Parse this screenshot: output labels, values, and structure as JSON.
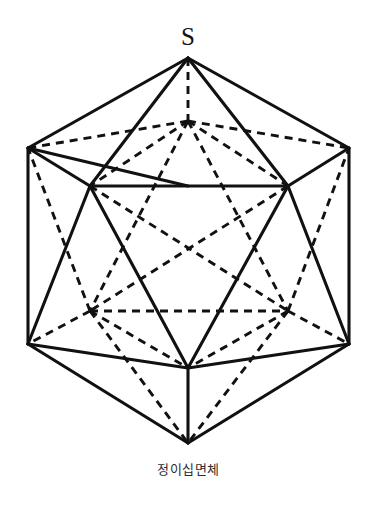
{
  "figure": {
    "caption": "정이십면체",
    "apex_label": "S",
    "colors": {
      "background": "#ffffff",
      "line": "#111111",
      "caption": "#2b2b2b"
    },
    "style": {
      "visible_edge": "solid",
      "hidden_edge": "dashed"
    },
    "vertices": [
      {
        "id": "S",
        "name": "top-apex",
        "x": 188,
        "y": 58,
        "visible": true
      },
      {
        "id": "B",
        "name": "upper-back-hidden",
        "x": 188,
        "y": 121,
        "visible": false
      },
      {
        "id": "UL",
        "name": "upper-outer-left",
        "x": 28,
        "y": 148,
        "visible": true
      },
      {
        "id": "UR",
        "name": "upper-outer-right",
        "x": 349,
        "y": 148,
        "visible": true
      },
      {
        "id": "FL",
        "name": "upper-front-left",
        "x": 90,
        "y": 186,
        "visible": true
      },
      {
        "id": "FR",
        "name": "upper-front-right",
        "x": 288,
        "y": 186,
        "visible": true
      },
      {
        "id": "HL",
        "name": "lower-back-left",
        "x": 90,
        "y": 311,
        "visible": false
      },
      {
        "id": "HR",
        "name": "lower-back-right",
        "x": 288,
        "y": 311,
        "visible": false
      },
      {
        "id": "LL",
        "name": "lower-outer-left",
        "x": 28,
        "y": 344,
        "visible": true
      },
      {
        "id": "LR",
        "name": "lower-outer-right",
        "x": 349,
        "y": 344,
        "visible": true
      },
      {
        "id": "FB",
        "name": "lower-front-bottom",
        "x": 188,
        "y": 368,
        "visible": true
      },
      {
        "id": "N",
        "name": "bottom-apex",
        "x": 188,
        "y": 443,
        "visible": true
      }
    ],
    "edges_visible": [
      [
        188,
        58,
        28,
        148
      ],
      [
        188,
        58,
        90,
        186
      ],
      [
        188,
        58,
        288,
        186
      ],
      [
        188,
        58,
        349,
        148
      ],
      [
        28,
        148,
        90,
        186
      ],
      [
        90,
        186,
        288,
        186
      ],
      [
        288,
        186,
        349,
        148
      ],
      [
        28,
        148,
        28,
        344
      ],
      [
        349,
        148,
        349,
        344
      ],
      [
        28,
        148,
        188,
        186
      ],
      [
        90,
        186,
        28,
        344
      ],
      [
        288,
        186,
        349,
        344
      ],
      [
        90,
        186,
        188,
        368
      ],
      [
        288,
        186,
        188,
        368
      ],
      [
        28,
        344,
        188,
        368
      ],
      [
        349,
        344,
        188,
        368
      ],
      [
        28,
        344,
        188,
        443
      ],
      [
        349,
        344,
        188,
        443
      ],
      [
        188,
        368,
        188,
        443
      ]
    ],
    "edges_hidden": [
      [
        188,
        58,
        188,
        121
      ],
      [
        188,
        121,
        28,
        148
      ],
      [
        188,
        121,
        349,
        148
      ],
      [
        188,
        121,
        90,
        186
      ],
      [
        188,
        121,
        288,
        186
      ],
      [
        188,
        121,
        90,
        311
      ],
      [
        188,
        121,
        288,
        311
      ],
      [
        90,
        186,
        288,
        311
      ],
      [
        288,
        186,
        90,
        311
      ],
      [
        90,
        311,
        288,
        311
      ],
      [
        90,
        311,
        28,
        148
      ],
      [
        288,
        311,
        349,
        148
      ],
      [
        90,
        311,
        28,
        344
      ],
      [
        288,
        311,
        349,
        344
      ],
      [
        90,
        311,
        188,
        443
      ],
      [
        288,
        311,
        188,
        443
      ],
      [
        90,
        311,
        188,
        368
      ],
      [
        288,
        311,
        188,
        368
      ]
    ]
  }
}
